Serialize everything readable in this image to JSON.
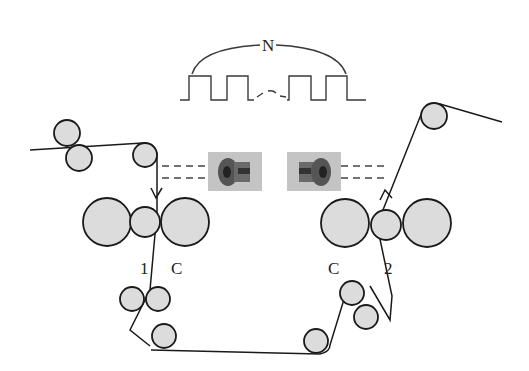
{
  "diagram": {
    "labels": {
      "pulse_count": "N",
      "roller_left_id": "1",
      "roller_left_cap": "C",
      "roller_right_cap": "C",
      "roller_right_id": "2"
    },
    "components": {
      "pulse_train": {
        "pulses_shown": 4,
        "gap_marker": "~"
      },
      "sensors": [
        {
          "name": "left-sensor"
        },
        {
          "name": "right-sensor"
        }
      ],
      "roller_groups": [
        "top-left-guide",
        "nip-1",
        "bottom-left-guide",
        "bottom-right-guide",
        "nip-2",
        "top-right-guide"
      ]
    },
    "colors": {
      "roller_fill": "#dcdcdc",
      "stroke": "#1a1a1a",
      "sensor_bg": "#bdbdbd"
    }
  }
}
